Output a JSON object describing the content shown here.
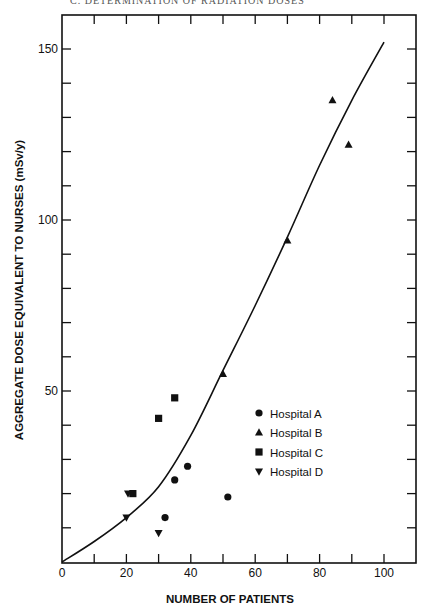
{
  "header": {
    "running_text": "C. DETERMINATION OF RADIATION DOSES"
  },
  "chart_data": {
    "type": "scatter",
    "title": "",
    "xlabel": "NUMBER OF PATIENTS",
    "ylabel": "AGGREGATE DOSE EQUIVALENT TO NURSES (mSv/y)",
    "xlim": [
      0,
      110
    ],
    "ylim": [
      0,
      160
    ],
    "x_ticks": [
      0,
      20,
      40,
      60,
      80,
      100
    ],
    "x_minor_ticks": [
      10,
      30,
      50,
      70,
      90
    ],
    "y_ticks": [
      50,
      100,
      150
    ],
    "y_minor_ticks": [
      10,
      20,
      30,
      40,
      60,
      70,
      80,
      90,
      110,
      120,
      130,
      140
    ],
    "grid": false,
    "legend_position": "lower right (inside plot)",
    "series": [
      {
        "name": "Hospital A",
        "marker": "circle",
        "points": [
          [
            32,
            13
          ],
          [
            35,
            24
          ],
          [
            39,
            28
          ],
          [
            51.5,
            19
          ]
        ]
      },
      {
        "name": "Hospital B",
        "marker": "triangle-up",
        "points": [
          [
            50,
            55
          ],
          [
            70,
            94
          ],
          [
            84,
            135
          ],
          [
            89,
            122
          ]
        ]
      },
      {
        "name": "Hospital C",
        "marker": "square",
        "points": [
          [
            22,
            20
          ],
          [
            30,
            42
          ],
          [
            35,
            48
          ]
        ]
      },
      {
        "name": "Hospital D",
        "marker": "triangle-down",
        "points": [
          [
            20,
            13
          ],
          [
            20.5,
            20
          ],
          [
            30,
            8.5
          ]
        ]
      }
    ],
    "fit_curve": {
      "name": "fitted curve",
      "points": [
        [
          0,
          0
        ],
        [
          10,
          6
        ],
        [
          20,
          13
        ],
        [
          30,
          22
        ],
        [
          40,
          37
        ],
        [
          50,
          56
        ],
        [
          60,
          75
        ],
        [
          70,
          95
        ],
        [
          80,
          116
        ],
        [
          90,
          135
        ],
        [
          100,
          152
        ]
      ]
    }
  },
  "axes": {
    "x_tick_labels": [
      "0",
      "20",
      "40",
      "60",
      "80",
      "100"
    ],
    "y_tick_labels": [
      "50",
      "100",
      "150"
    ]
  },
  "legend": {
    "items": [
      {
        "label": "Hospital A",
        "marker": "circle"
      },
      {
        "label": "Hospital B",
        "marker": "triangle-up"
      },
      {
        "label": "Hospital C",
        "marker": "square"
      },
      {
        "label": "Hospital D",
        "marker": "triangle-down"
      }
    ]
  },
  "colors": {
    "ink": "#111111",
    "background": "#ffffff"
  }
}
